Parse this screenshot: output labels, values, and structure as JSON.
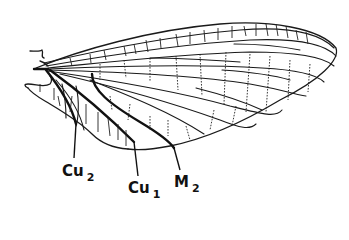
{
  "figure": {
    "labels": [
      {
        "id": "cu2",
        "base": "Cu",
        "subscript": "2",
        "x": 62,
        "y": 164
      },
      {
        "id": "cu1",
        "base": "Cu",
        "subscript": "1",
        "x": 128,
        "y": 181
      },
      {
        "id": "m2",
        "base": "M",
        "subscript": "2",
        "x": 174,
        "y": 175
      }
    ],
    "colors": {
      "line": "#1a1a1a",
      "background": "#ffffff"
    }
  }
}
